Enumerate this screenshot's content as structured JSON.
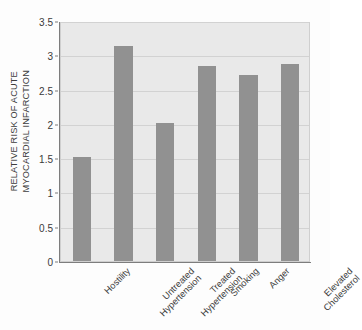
{
  "chart_data": {
    "type": "bar",
    "title": "",
    "subtitle": "",
    "xlabel": "",
    "ylabel": "RELATIVE RISK OF ACUTE MYOCARDIAL INFARCTION",
    "ylabel_lines": [
      "RELATIVE RISK OF ACUTE",
      "MYOCARDIAL INFARCTION"
    ],
    "categories": [
      "Hostility",
      "Untreated Hypertension",
      "Treated Hypertension",
      "Smoking",
      "Anger",
      "Elevated Cholesterol"
    ],
    "category_lines": [
      [
        "Hostility"
      ],
      [
        "Untreated",
        "Hypertension"
      ],
      [
        "Treated",
        "Hypertension"
      ],
      [
        "Smoking"
      ],
      [
        "Anger"
      ],
      [
        "Elevated",
        "Cholesterol"
      ]
    ],
    "values": [
      1.51,
      3.13,
      2.02,
      2.85,
      2.72,
      2.87
    ],
    "ylim": [
      0,
      3.5
    ],
    "yticks": [
      0,
      0.5,
      1,
      1.5,
      2,
      2.5,
      3,
      3.5
    ],
    "ytick_labels": [
      "0",
      "0.5",
      "1",
      "1.5",
      "2",
      "2.5",
      "3",
      "3.5"
    ],
    "grid": true,
    "grid_axis": "y",
    "legend": false,
    "legend_position": "none",
    "bar_color": "#919191",
    "plot_background": "#e9e9e9",
    "gridline_color": "#d2d2d2",
    "axis_color": "#7d7d7d",
    "figure_background": "#fdfdfd"
  }
}
